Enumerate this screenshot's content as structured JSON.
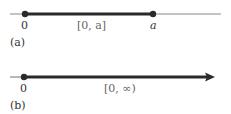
{
  "figure_a": {
    "origin_label": "0",
    "interval_label": "[0, a]",
    "endpoint_label": "a",
    "caption": "(a)"
  },
  "figure_b": {
    "origin_label": "0",
    "interval_label": "[0, ∞)",
    "caption": "(b)"
  },
  "colors": {
    "line": "#2a2a2a",
    "thin_line": "#777777"
  }
}
